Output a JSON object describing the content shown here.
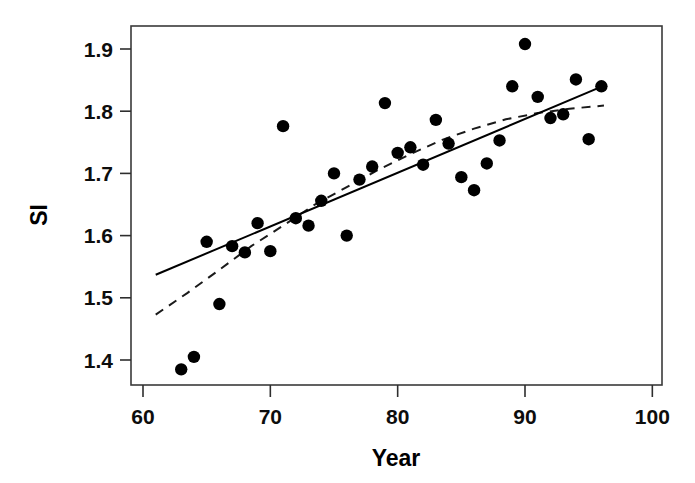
{
  "chart_data": {
    "type": "scatter",
    "title": "",
    "xlabel": "Year",
    "ylabel": "SI",
    "xlim": [
      60,
      100
    ],
    "ylim": [
      1.355,
      1.935
    ],
    "xticks": [
      60,
      70,
      80,
      90,
      100
    ],
    "yticks": [
      1.4,
      1.5,
      1.6,
      1.7,
      1.8,
      1.9
    ],
    "xtick_labels": [
      "60",
      "70",
      "80",
      "90",
      "100"
    ],
    "ytick_labels": [
      "1.4",
      "1.5",
      "1.6",
      "1.7",
      "1.8",
      "1.9"
    ],
    "grid": false,
    "legend": "none",
    "marker": "filled-circle",
    "marker_color": "#000000",
    "x": [
      63,
      64,
      65,
      66,
      67,
      68,
      69,
      70,
      71,
      72,
      73,
      74,
      75,
      76,
      77,
      78,
      79,
      80,
      81,
      82,
      83,
      84,
      85,
      86,
      87,
      88,
      89,
      90,
      91,
      92,
      93,
      94,
      95,
      96
    ],
    "y": [
      1.385,
      1.405,
      1.59,
      1.49,
      1.583,
      1.573,
      1.62,
      1.575,
      1.776,
      1.628,
      1.616,
      1.656,
      1.7,
      1.6,
      1.69,
      1.711,
      1.813,
      1.733,
      1.742,
      1.714,
      1.786,
      1.748,
      1.694,
      1.673,
      1.716,
      1.753,
      1.84,
      1.908,
      1.823,
      1.789,
      1.795,
      1.851,
      1.755,
      1.84
    ],
    "series": [
      {
        "name": "observations",
        "type": "scatter",
        "points": [
          {
            "x": 63,
            "y": 1.385
          },
          {
            "x": 64,
            "y": 1.405
          },
          {
            "x": 65,
            "y": 1.59
          },
          {
            "x": 66,
            "y": 1.49
          },
          {
            "x": 67,
            "y": 1.583
          },
          {
            "x": 68,
            "y": 1.573
          },
          {
            "x": 69,
            "y": 1.62
          },
          {
            "x": 70,
            "y": 1.575
          },
          {
            "x": 71,
            "y": 1.776
          },
          {
            "x": 72,
            "y": 1.628
          },
          {
            "x": 73,
            "y": 1.616
          },
          {
            "x": 74,
            "y": 1.656
          },
          {
            "x": 75,
            "y": 1.7
          },
          {
            "x": 76,
            "y": 1.6
          },
          {
            "x": 77,
            "y": 1.69
          },
          {
            "x": 78,
            "y": 1.711
          },
          {
            "x": 79,
            "y": 1.813
          },
          {
            "x": 80,
            "y": 1.733
          },
          {
            "x": 81,
            "y": 1.742
          },
          {
            "x": 82,
            "y": 1.714
          },
          {
            "x": 83,
            "y": 1.786
          },
          {
            "x": 84,
            "y": 1.748
          },
          {
            "x": 85,
            "y": 1.694
          },
          {
            "x": 86,
            "y": 1.673
          },
          {
            "x": 87,
            "y": 1.716
          },
          {
            "x": 88,
            "y": 1.753
          },
          {
            "x": 89,
            "y": 1.84
          },
          {
            "x": 90,
            "y": 1.908
          },
          {
            "x": 91,
            "y": 1.823
          },
          {
            "x": 92,
            "y": 1.789
          },
          {
            "x": 93,
            "y": 1.795
          },
          {
            "x": 94,
            "y": 1.851
          },
          {
            "x": 95,
            "y": 1.755
          },
          {
            "x": 96,
            "y": 1.84
          }
        ]
      },
      {
        "name": "linear-fit",
        "type": "line",
        "style": "solid",
        "points": [
          {
            "x": 61.0,
            "y": 1.537
          },
          {
            "x": 96.2,
            "y": 1.841
          }
        ]
      },
      {
        "name": "smoothed-fit",
        "type": "line",
        "style": "dashed",
        "points": [
          {
            "x": 61.0,
            "y": 1.473
          },
          {
            "x": 63.5,
            "y": 1.508
          },
          {
            "x": 66.0,
            "y": 1.545
          },
          {
            "x": 68.5,
            "y": 1.583
          },
          {
            "x": 71.0,
            "y": 1.616
          },
          {
            "x": 73.5,
            "y": 1.65
          },
          {
            "x": 76.0,
            "y": 1.678
          },
          {
            "x": 78.5,
            "y": 1.706
          },
          {
            "x": 81.0,
            "y": 1.731
          },
          {
            "x": 83.5,
            "y": 1.754
          },
          {
            "x": 86.0,
            "y": 1.772
          },
          {
            "x": 88.5,
            "y": 1.787
          },
          {
            "x": 91.0,
            "y": 1.797
          },
          {
            "x": 93.5,
            "y": 1.804
          },
          {
            "x": 96.2,
            "y": 1.809
          }
        ]
      }
    ]
  },
  "axes": {
    "x_title": "Year",
    "y_title": "SI"
  }
}
